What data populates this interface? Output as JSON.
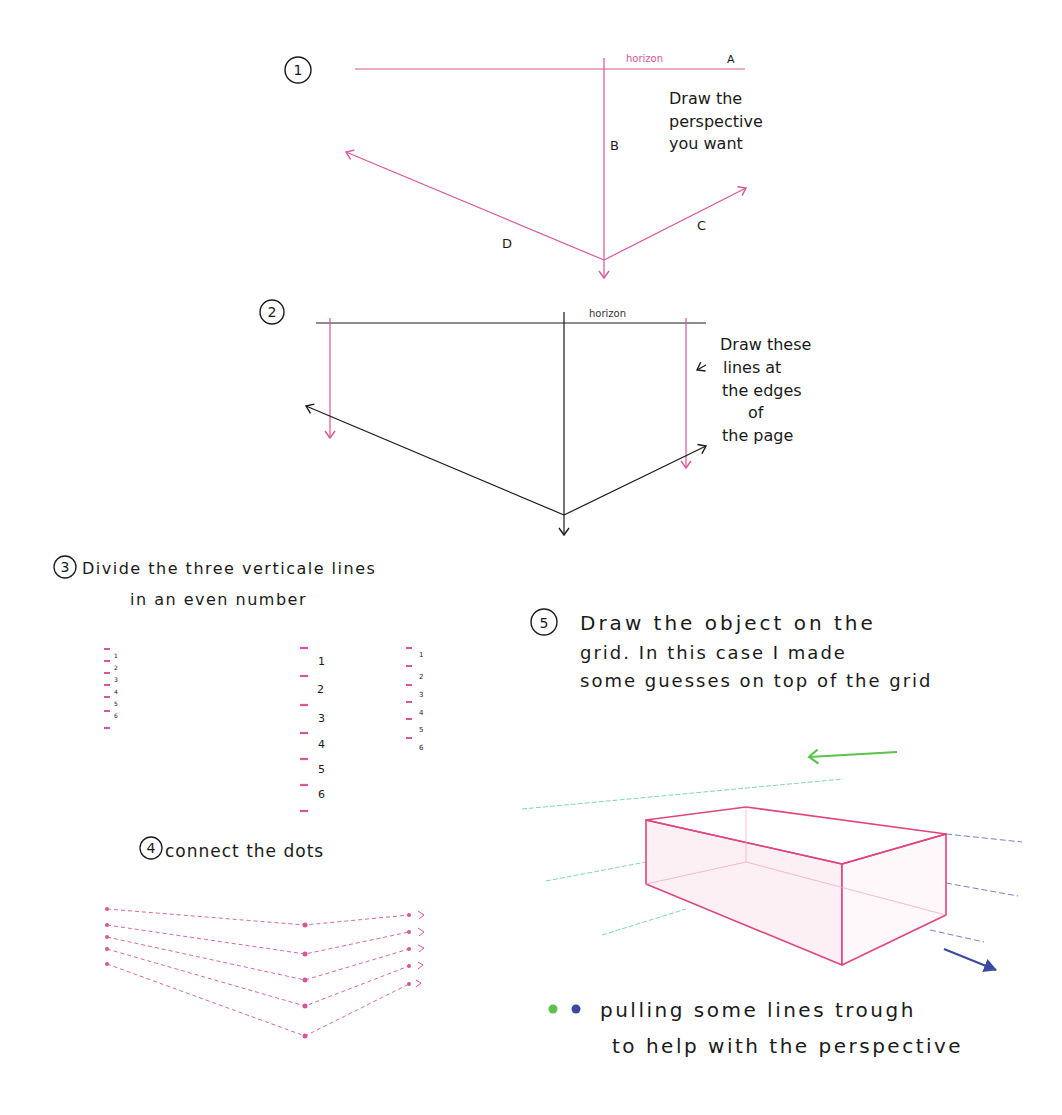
{
  "colors": {
    "pink": "#d9559a",
    "pink_box": "#e0457f",
    "black": "#1a1a1a",
    "green": "#5cc24a",
    "cyan_green": "#7fd8b0",
    "blue": "#3a4aa0",
    "blue_light": "#7a80c8"
  },
  "step1": {
    "number": "1",
    "horizon_label": "horizon",
    "label_a": "A",
    "label_b": "B",
    "label_c": "C",
    "label_d": "D",
    "note": [
      "Draw the",
      "perspective",
      "you want"
    ]
  },
  "step2": {
    "number": "2",
    "horizon_label": "horizon",
    "note": [
      "Draw these",
      "lines at",
      "the edges",
      "of",
      "the page"
    ]
  },
  "step3": {
    "number": "3",
    "title_line1": "Divide the three verticale lines",
    "title_line2": "in an even number",
    "left_ticks": [
      "1",
      "2",
      "3",
      "4",
      "5",
      "6"
    ],
    "center_ticks": [
      "1",
      "2",
      "3",
      "4",
      "5",
      "6"
    ],
    "right_ticks": [
      "1",
      "2",
      "3",
      "4",
      "5",
      "6"
    ]
  },
  "step4": {
    "number": "4",
    "title": "connect the dots"
  },
  "step5": {
    "number": "5",
    "title_line1": "Draw the object on the",
    "title_line2": "grid. In this case I made",
    "title_line3": "some guesses on top of the grid"
  },
  "legend": {
    "line1": "pulling some lines trough",
    "line2": "to help with the perspective",
    "dots": [
      "green",
      "blue"
    ]
  }
}
